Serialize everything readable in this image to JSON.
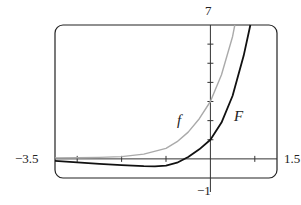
{
  "chart_data": {
    "type": "line",
    "title": "",
    "xlabel": "",
    "ylabel": "",
    "xlim": [
      -3.5,
      1.5
    ],
    "ylim": [
      -1,
      7
    ],
    "grid": false,
    "x_ticks": [
      -3,
      -2,
      -1,
      0,
      1
    ],
    "y_ticks": [
      1,
      2,
      3,
      4,
      5,
      6
    ],
    "series": [
      {
        "name": "f",
        "color": "#aaaaaa",
        "x": [
          -3.5,
          -3,
          -2.5,
          -2,
          -1.5,
          -1,
          -0.75,
          -0.5,
          -0.25,
          0,
          0.25,
          0.5,
          0.55
        ],
        "y": [
          0.05,
          0.06,
          0.08,
          0.12,
          0.25,
          0.55,
          0.9,
          1.4,
          2.1,
          3.0,
          4.4,
          6.4,
          7.0
        ]
      },
      {
        "name": "F",
        "color": "#111111",
        "x": [
          -3.5,
          -3,
          -2.5,
          -2,
          -1.5,
          -1.25,
          -1,
          -0.75,
          -0.5,
          -0.25,
          0,
          0.25,
          0.5,
          0.75,
          0.9
        ],
        "y": [
          -0.1,
          -0.18,
          -0.26,
          -0.33,
          -0.38,
          -0.39,
          -0.35,
          -0.2,
          0.1,
          0.5,
          1.0,
          1.9,
          3.3,
          5.4,
          7.0
        ]
      }
    ],
    "annotations": [
      {
        "text": "f",
        "x": -0.5,
        "y": 2.0
      },
      {
        "text": "F",
        "x": 0.55,
        "y": 2.4
      }
    ]
  },
  "labels": {
    "xmin": "−3.5",
    "xmax": "1.5",
    "ymax": "7",
    "ymin": "−1",
    "f": "f",
    "F": "F"
  }
}
